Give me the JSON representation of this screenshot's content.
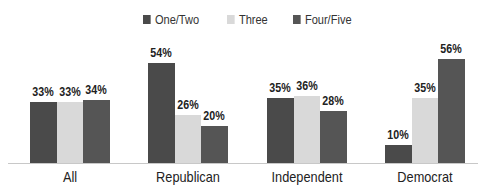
{
  "chart_data": {
    "type": "bar",
    "title": "",
    "xlabel": "",
    "ylabel": "",
    "ylim": [
      0,
      60
    ],
    "grid": false,
    "legend_position": "top",
    "categories": [
      "All",
      "Republican",
      "Independent",
      "Democrat"
    ],
    "series": [
      {
        "name": "One/Two",
        "color": "#4a4a4a",
        "values": [
          33,
          54,
          35,
          10
        ],
        "labels": [
          "33%",
          "54%",
          "35%",
          "10%"
        ]
      },
      {
        "name": "Three",
        "color": "#d9d9d9",
        "values": [
          33,
          26,
          36,
          35
        ],
        "labels": [
          "33%",
          "26%",
          "36%",
          "35%"
        ]
      },
      {
        "name": "Four/Five",
        "color": "#555555",
        "values": [
          34,
          20,
          28,
          56
        ],
        "labels": [
          "34%",
          "20%",
          "28%",
          "56%"
        ]
      }
    ]
  }
}
